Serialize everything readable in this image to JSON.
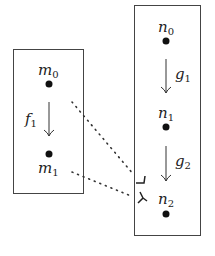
{
  "diagram": {
    "left_box": {
      "nodes": [
        {
          "id": "m0",
          "base": "m",
          "sub": "0"
        },
        {
          "id": "m1",
          "base": "m",
          "sub": "1"
        }
      ],
      "arrows": [
        {
          "from": "m0",
          "to": "m1",
          "base": "f",
          "sub": "1"
        }
      ]
    },
    "right_box": {
      "nodes": [
        {
          "id": "n0",
          "base": "n",
          "sub": "0"
        },
        {
          "id": "n1",
          "base": "n",
          "sub": "1"
        },
        {
          "id": "n2",
          "base": "n",
          "sub": "2"
        }
      ],
      "arrows": [
        {
          "from": "n0",
          "to": "n1",
          "base": "g",
          "sub": "1"
        },
        {
          "from": "n1",
          "to": "n2",
          "base": "g",
          "sub": "2"
        }
      ]
    },
    "cross_links": [
      {
        "from": "m0",
        "to": "n2",
        "style": "dotted"
      },
      {
        "from": "m1",
        "to": "n2",
        "style": "dotted"
      }
    ],
    "colors": {
      "ink": "#222222",
      "frame": "#444444",
      "background": "#ffffff"
    }
  }
}
